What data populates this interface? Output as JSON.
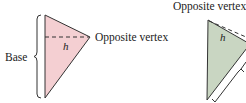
{
  "left_figure": {
    "base_label": "Base",
    "height_label": "h",
    "vertex_label": "Opposite vertex",
    "fill_color": "#f4cfd2"
  },
  "right_figure": {
    "vertex_label": "Opposite vertex",
    "height_label": "h",
    "fill_color": "#c9d6c2"
  }
}
